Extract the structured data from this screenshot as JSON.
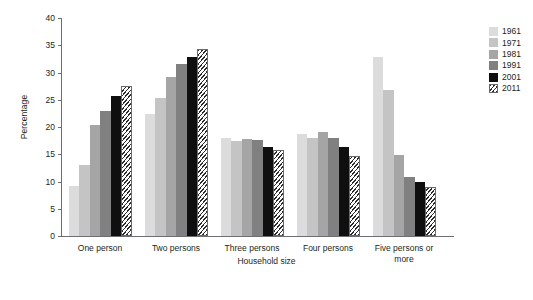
{
  "chart_data": {
    "type": "bar",
    "title": "",
    "subtitle": "",
    "xlabel": "Household size",
    "ylabel": "Percentage",
    "ylim": [
      0,
      40
    ],
    "yticks": [
      0,
      5,
      10,
      15,
      20,
      25,
      30,
      35,
      40
    ],
    "grid": false,
    "legend_position": "top-right",
    "categories": [
      "One person",
      "Two persons",
      "Three persons",
      "Four persons",
      "Five persons or more"
    ],
    "series": [
      {
        "name": "1961",
        "color": "#dcdcdc",
        "values": [
          9.2,
          22.3,
          17.9,
          18.7,
          32.8
        ]
      },
      {
        "name": "1971",
        "color": "#c4c4c4",
        "values": [
          13.0,
          25.3,
          17.4,
          17.9,
          26.8
        ]
      },
      {
        "name": "1981",
        "color": "#a5a5a5",
        "values": [
          20.3,
          29.1,
          17.8,
          19.0,
          14.9
        ]
      },
      {
        "name": "1991",
        "color": "#808080",
        "values": [
          22.9,
          31.5,
          17.6,
          18.0,
          10.8
        ]
      },
      {
        "name": "2001",
        "color": "#100f0f",
        "values": [
          25.6,
          32.9,
          16.3,
          16.4,
          9.9
        ]
      },
      {
        "name": "2011",
        "color": "hatched",
        "values": [
          27.6,
          34.3,
          15.8,
          14.6,
          9.0
        ]
      }
    ]
  }
}
